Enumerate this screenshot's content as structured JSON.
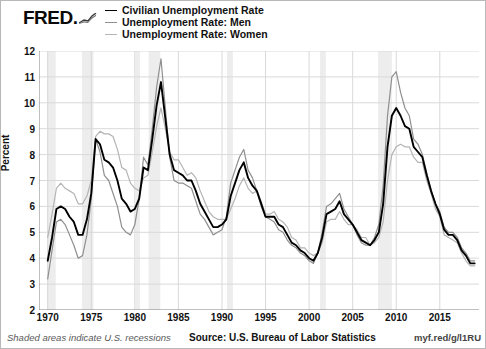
{
  "brand": {
    "name": "FRED.",
    "spark_icon": "trend-up-icon"
  },
  "legend": {
    "position": "top-left",
    "entries": [
      {
        "label": "Civilian Unemployment Rate",
        "color": "#000000",
        "width": 1.9
      },
      {
        "label": "Unemployment Rate: Men",
        "color": "#8f8f8f",
        "width": 1.2
      },
      {
        "label": "Unemployment Rate: Women",
        "color": "#b4b4b4",
        "width": 1.2
      }
    ]
  },
  "footer": {
    "recession_note": "Shaded areas indicate U.S. recessions",
    "source": "Source: U.S. Bureau of Labor Statistics",
    "short_url": "myf.red/g/l1RU"
  },
  "colors": {
    "civilian": "#000000",
    "men": "#8f8f8f",
    "women": "#b4b4b4",
    "grid": "#d9d9d9",
    "axis": "#808080",
    "recession_band": "#ededed",
    "background": "#ffffff"
  },
  "chart_data": {
    "type": "line",
    "title": "",
    "xlabel": "",
    "ylabel": "Percent",
    "xlim": [
      1969.0,
      2019.5
    ],
    "ylim": [
      2,
      12
    ],
    "yticks": [
      2,
      3,
      4,
      5,
      6,
      7,
      8,
      9,
      10,
      11,
      12
    ],
    "xticks": [
      1970,
      1975,
      1980,
      1985,
      1990,
      1995,
      2000,
      2005,
      2010,
      2015
    ],
    "grid": true,
    "legend_position": "top-left",
    "annotations": [
      "Shaded areas indicate U.S. recessions"
    ],
    "recessions": [
      {
        "start": 1969.92,
        "end": 1970.92
      },
      {
        "start": 1973.92,
        "end": 1975.25
      },
      {
        "start": 1980.08,
        "end": 1980.58
      },
      {
        "start": 1981.58,
        "end": 1982.92
      },
      {
        "start": 1990.58,
        "end": 1991.25
      },
      {
        "start": 2001.25,
        "end": 2001.92
      },
      {
        "start": 2007.92,
        "end": 2009.5
      }
    ],
    "x": [
      1970.0,
      1970.5,
      1971.0,
      1971.5,
      1972.0,
      1972.5,
      1973.0,
      1973.5,
      1974.0,
      1974.5,
      1975.0,
      1975.5,
      1976.0,
      1976.5,
      1977.0,
      1977.5,
      1978.0,
      1978.5,
      1979.0,
      1979.5,
      1980.0,
      1980.5,
      1981.0,
      1981.5,
      1982.0,
      1982.5,
      1983.0,
      1983.5,
      1984.0,
      1984.5,
      1985.0,
      1985.5,
      1986.0,
      1986.5,
      1987.0,
      1987.5,
      1988.0,
      1988.5,
      1989.0,
      1989.5,
      1990.0,
      1990.5,
      1991.0,
      1991.5,
      1992.0,
      1992.5,
      1993.0,
      1993.5,
      1994.0,
      1994.5,
      1995.0,
      1995.5,
      1996.0,
      1996.5,
      1997.0,
      1997.5,
      1998.0,
      1998.5,
      1999.0,
      1999.5,
      2000.0,
      2000.5,
      2001.0,
      2001.5,
      2002.0,
      2002.5,
      2003.0,
      2003.5,
      2004.0,
      2004.5,
      2005.0,
      2005.5,
      2006.0,
      2006.5,
      2007.0,
      2007.5,
      2008.0,
      2008.5,
      2009.0,
      2009.5,
      2010.0,
      2010.5,
      2011.0,
      2011.5,
      2012.0,
      2012.5,
      2013.0,
      2013.5,
      2014.0,
      2014.5,
      2015.0,
      2015.5,
      2016.0,
      2016.5,
      2017.0,
      2017.5,
      2018.0,
      2018.5,
      2019.0
    ],
    "series": [
      {
        "name": "Civilian Unemployment Rate",
        "color": "#000000",
        "values": [
          3.9,
          4.8,
          5.9,
          6.0,
          5.9,
          5.6,
          5.4,
          4.9,
          4.9,
          5.5,
          6.5,
          8.6,
          8.4,
          7.8,
          7.7,
          7.5,
          7.0,
          6.3,
          6.1,
          5.8,
          5.9,
          6.3,
          7.5,
          7.4,
          8.6,
          9.9,
          10.8,
          9.4,
          8.0,
          7.4,
          7.3,
          7.2,
          7.0,
          7.0,
          6.6,
          6.1,
          5.8,
          5.5,
          5.2,
          5.2,
          5.3,
          5.5,
          6.4,
          6.9,
          7.4,
          7.7,
          7.1,
          6.8,
          6.6,
          6.1,
          5.6,
          5.6,
          5.6,
          5.3,
          5.2,
          4.9,
          4.6,
          4.5,
          4.3,
          4.2,
          4.0,
          3.9,
          4.2,
          4.8,
          5.7,
          5.8,
          5.9,
          6.2,
          5.7,
          5.5,
          5.3,
          5.0,
          4.7,
          4.6,
          4.5,
          4.7,
          5.0,
          6.1,
          8.3,
          9.5,
          9.8,
          9.5,
          9.1,
          9.0,
          8.3,
          8.1,
          7.9,
          7.2,
          6.6,
          6.1,
          5.7,
          5.1,
          4.9,
          4.9,
          4.7,
          4.3,
          4.1,
          3.8,
          3.8
        ]
      },
      {
        "name": "Unemployment Rate: Men",
        "color": "#8f8f8f",
        "values": [
          3.2,
          4.3,
          5.4,
          5.5,
          5.3,
          4.9,
          4.5,
          4.0,
          4.1,
          4.9,
          6.3,
          8.6,
          8.1,
          7.2,
          7.0,
          6.5,
          6.0,
          5.2,
          5.0,
          4.9,
          5.3,
          6.3,
          7.9,
          7.6,
          9.0,
          10.6,
          11.7,
          9.8,
          7.9,
          7.0,
          6.9,
          6.9,
          6.8,
          6.7,
          6.2,
          5.7,
          5.5,
          5.2,
          4.9,
          5.0,
          5.1,
          5.6,
          6.9,
          7.4,
          7.9,
          8.2,
          7.4,
          7.1,
          6.6,
          6.0,
          5.6,
          5.5,
          5.4,
          5.1,
          5.0,
          4.7,
          4.5,
          4.4,
          4.2,
          4.1,
          3.9,
          3.8,
          4.2,
          5.0,
          6.0,
          6.1,
          6.3,
          6.5,
          5.9,
          5.6,
          5.3,
          4.9,
          4.6,
          4.5,
          4.5,
          4.8,
          5.3,
          6.8,
          9.5,
          11.0,
          11.2,
          10.4,
          9.8,
          9.5,
          8.6,
          8.4,
          8.0,
          7.3,
          6.6,
          6.1,
          5.8,
          5.2,
          5.0,
          5.0,
          4.8,
          4.4,
          4.2,
          3.9,
          3.9
        ]
      },
      {
        "name": "Unemployment Rate: Women",
        "color": "#b4b4b4",
        "values": [
          4.8,
          5.7,
          6.7,
          6.9,
          6.7,
          6.6,
          6.5,
          6.1,
          6.1,
          6.4,
          7.0,
          8.7,
          8.9,
          8.8,
          8.8,
          8.7,
          8.2,
          7.5,
          7.4,
          6.9,
          6.7,
          6.6,
          7.1,
          7.2,
          8.1,
          9.1,
          9.8,
          9.0,
          8.1,
          7.8,
          7.8,
          7.5,
          7.2,
          7.3,
          7.1,
          6.6,
          6.2,
          5.8,
          5.6,
          5.5,
          5.5,
          5.5,
          5.9,
          6.3,
          6.8,
          7.1,
          6.7,
          6.5,
          6.6,
          6.2,
          5.7,
          5.7,
          5.8,
          5.5,
          5.4,
          5.2,
          4.8,
          4.7,
          4.4,
          4.4,
          4.2,
          4.1,
          4.2,
          4.6,
          5.4,
          5.5,
          5.5,
          5.8,
          5.5,
          5.3,
          5.3,
          5.1,
          4.8,
          4.8,
          4.5,
          4.6,
          4.8,
          5.4,
          7.0,
          8.0,
          8.3,
          8.4,
          8.3,
          8.3,
          7.9,
          7.7,
          7.7,
          7.0,
          6.5,
          5.9,
          5.6,
          4.9,
          4.8,
          4.7,
          4.6,
          4.2,
          3.9,
          3.7,
          3.7
        ]
      }
    ]
  }
}
